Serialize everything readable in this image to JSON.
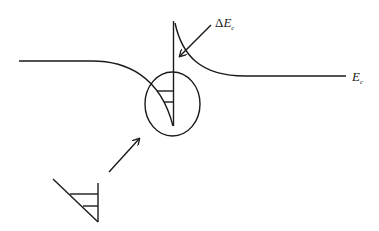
{
  "diagram": {
    "type": "band-diagram",
    "labels": {
      "delta_prefix": "Δ",
      "delta_main": "E",
      "delta_sub": "c",
      "ec_main": "E",
      "ec_sub": "c"
    },
    "colors": {
      "stroke": "#1a1a1a",
      "background": "#ffffff"
    }
  }
}
